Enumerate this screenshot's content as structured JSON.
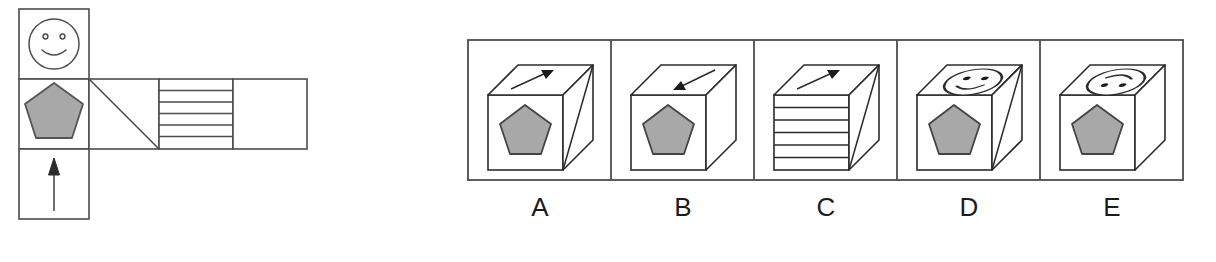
{
  "puzzle": {
    "type": "cube-folding-spatial-reasoning",
    "stroke_color": "#4d4d4d",
    "ink_color": "#1c1c1c",
    "shape_fill": "#a8a8a8",
    "shape_stroke": "#555555",
    "background": "#ffffff"
  },
  "prompt": {
    "name": "cube-net",
    "description": "Unfolded cube net",
    "cell_size": 70,
    "faces": [
      {
        "id": "face-smiley",
        "symbol": "smiley-face",
        "col": 0,
        "row": 0
      },
      {
        "id": "face-pentagon",
        "symbol": "gray-pentagon",
        "col": 0,
        "row": 1
      },
      {
        "id": "face-arrow",
        "symbol": "up-arrow",
        "col": 0,
        "row": 2
      },
      {
        "id": "face-diagonal",
        "symbol": "diagonal-line",
        "col": 1,
        "row": 1
      },
      {
        "id": "face-stripes",
        "symbol": "horizontal-stripes",
        "col": 2,
        "row": 1,
        "stripe_lines": 5
      },
      {
        "id": "face-blank",
        "symbol": "blank",
        "col": 3,
        "row": 1
      }
    ]
  },
  "options": {
    "name": "answer-options",
    "items": [
      {
        "label": "A",
        "front": "gray-pentagon",
        "top": "arrow-up-right",
        "right": "diagonal-line"
      },
      {
        "label": "B",
        "front": "gray-pentagon",
        "top": "arrow-down-left",
        "right": "blank"
      },
      {
        "label": "C",
        "front": "horizontal-stripes",
        "top": "arrow-up-right",
        "right": "diagonal-line"
      },
      {
        "label": "D",
        "front": "gray-pentagon",
        "top": "smiley-face",
        "right": "diagonal-line"
      },
      {
        "label": "E",
        "front": "gray-pentagon",
        "top": "frown-face",
        "right": "blank"
      }
    ]
  }
}
